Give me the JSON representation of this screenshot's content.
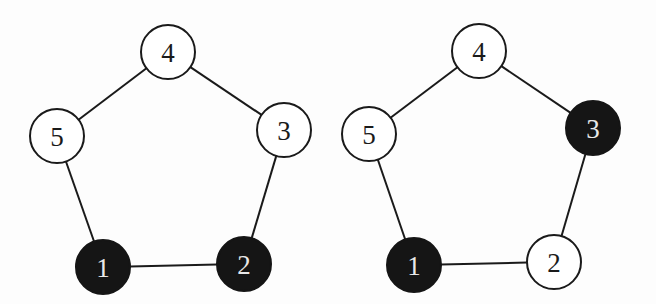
{
  "graphs": [
    {
      "name": "left-graph",
      "nodes": [
        {
          "id": "1",
          "label": "1",
          "x": 103,
          "y": 267,
          "filled": true
        },
        {
          "id": "2",
          "label": "2",
          "x": 244,
          "y": 264,
          "filled": true
        },
        {
          "id": "3",
          "label": "3",
          "x": 284,
          "y": 130,
          "filled": false
        },
        {
          "id": "4",
          "label": "4",
          "x": 168,
          "y": 52,
          "filled": false
        },
        {
          "id": "5",
          "label": "5",
          "x": 57,
          "y": 136,
          "filled": false
        }
      ],
      "edges": [
        [
          "1",
          "2"
        ],
        [
          "2",
          "3"
        ],
        [
          "3",
          "4"
        ],
        [
          "4",
          "5"
        ],
        [
          "5",
          "1"
        ]
      ]
    },
    {
      "name": "right-graph",
      "nodes": [
        {
          "id": "1",
          "label": "1",
          "x": 414,
          "y": 265,
          "filled": true
        },
        {
          "id": "2",
          "label": "2",
          "x": 554,
          "y": 262,
          "filled": false
        },
        {
          "id": "3",
          "label": "3",
          "x": 593,
          "y": 128,
          "filled": true
        },
        {
          "id": "4",
          "label": "4",
          "x": 479,
          "y": 51,
          "filled": false
        },
        {
          "id": "5",
          "label": "5",
          "x": 369,
          "y": 134,
          "filled": false
        }
      ],
      "edges": [
        [
          "1",
          "2"
        ],
        [
          "2",
          "3"
        ],
        [
          "3",
          "4"
        ],
        [
          "4",
          "5"
        ],
        [
          "5",
          "1"
        ]
      ]
    }
  ],
  "style": {
    "node_radius": 27,
    "fill_color": "#151515",
    "stroke_color": "#1a1a1a"
  }
}
